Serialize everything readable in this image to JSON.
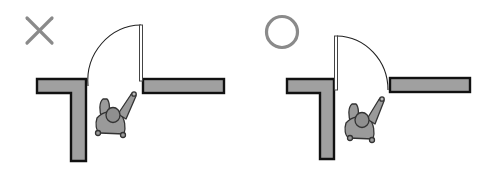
{
  "diagram": {
    "colors": {
      "wall_fill": "#a0a0a0",
      "wall_stroke": "#111111",
      "mark": "#8a8a8a",
      "person_fill": "#9a9a9a",
      "person_stroke": "#333333",
      "door_fill": "#ffffff",
      "door_stroke": "#444444",
      "background": "#ffffff"
    },
    "panels": [
      {
        "id": "incorrect",
        "mark": "cross-mark",
        "mark_label": "×",
        "description": "Door opens outward toward the person (incorrect)"
      },
      {
        "id": "correct",
        "mark": "circle-mark",
        "mark_label": "○",
        "description": "Door opens away from the person (correct)"
      }
    ]
  }
}
